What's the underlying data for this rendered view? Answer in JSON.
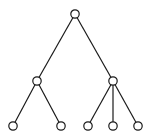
{
  "diagram": {
    "type": "tree",
    "colors": {
      "line": "#1a1a1a",
      "node_fill": "#ffffff",
      "background": "#ffffff"
    },
    "nodes": [
      {
        "id": "root",
        "label": ""
      },
      {
        "id": "a",
        "label": ""
      },
      {
        "id": "b",
        "label": ""
      },
      {
        "id": "a1",
        "label": ""
      },
      {
        "id": "a2",
        "label": ""
      },
      {
        "id": "b1",
        "label": ""
      },
      {
        "id": "b2",
        "label": ""
      },
      {
        "id": "b3",
        "label": ""
      }
    ],
    "edges": [
      {
        "from": "root",
        "to": "a"
      },
      {
        "from": "root",
        "to": "b"
      },
      {
        "from": "a",
        "to": "a1"
      },
      {
        "from": "a",
        "to": "a2"
      },
      {
        "from": "b",
        "to": "b1"
      },
      {
        "from": "b",
        "to": "b2"
      },
      {
        "from": "b",
        "to": "b3"
      }
    ]
  }
}
